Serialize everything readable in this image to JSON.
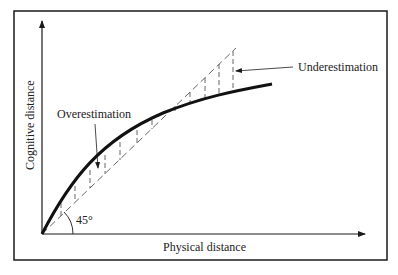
{
  "diagram": {
    "y_axis_label": "Cognitive distance",
    "x_axis_label": "Physical distance",
    "angle_label": "45°",
    "annotations": {
      "overestimation": "Overestimation",
      "underestimation": "Underestimation"
    },
    "colors": {
      "stroke": "#1a1a1a",
      "dashed": "#555555",
      "background": "#ffffff"
    }
  }
}
